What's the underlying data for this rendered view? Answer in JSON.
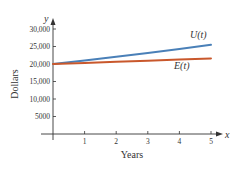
{
  "chart_data": {
    "type": "line",
    "title": "",
    "xlabel": "Years",
    "ylabel": "Dollars",
    "x_axis_var": "x",
    "y_axis_var": "y",
    "xlim": [
      0,
      5
    ],
    "ylim": [
      0,
      30000
    ],
    "grid": false,
    "legend_position": "inline labels",
    "x_ticks": [
      "1",
      "2",
      "3",
      "4",
      "5"
    ],
    "y_ticks": [
      "5000",
      "10,000",
      "15,000",
      "20,000",
      "25,000",
      "30,000"
    ],
    "x": [
      0,
      1,
      2,
      3,
      4,
      5
    ],
    "series": [
      {
        "name": "U(t)",
        "color": "#4a80b8",
        "values": [
          20000,
          21000,
          22050,
          23150,
          24300,
          25500
        ]
      },
      {
        "name": "E(t)",
        "color": "#c9582c",
        "values": [
          20000,
          20300,
          20650,
          20950,
          21300,
          21600
        ]
      }
    ]
  }
}
